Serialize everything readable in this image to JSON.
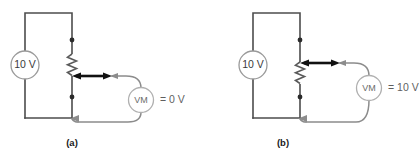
{
  "figure": {
    "background_color": "#ffffff",
    "wire_color": "#4d4d4d",
    "lead_color": "#8c8c8c",
    "accent_color": "#111111",
    "circuits": [
      {
        "id": "a",
        "caption": "(a)",
        "source_label": "10 V",
        "meter_label": "VM",
        "reading_label": "= 0 V",
        "wiper_position": "bottom"
      },
      {
        "id": "b",
        "caption": "(b)",
        "source_label": "10 V",
        "meter_label": "VM",
        "reading_label": "= 10 V",
        "wiper_position": "top"
      }
    ]
  }
}
